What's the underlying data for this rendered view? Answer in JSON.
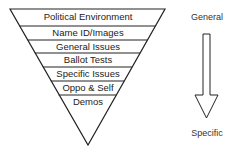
{
  "diagram": {
    "type": "inverted-funnel",
    "layers": [
      {
        "label": "Political Environment"
      },
      {
        "label": "Name ID/Images"
      },
      {
        "label": "General Issues"
      },
      {
        "label": "Ballot Tests"
      },
      {
        "label": "Specific Issues"
      },
      {
        "label": "Oppo & Self"
      },
      {
        "label": "Demos"
      }
    ],
    "arrow": {
      "top_label": "General",
      "bottom_label": "Specific",
      "direction": "down"
    },
    "colors": {
      "stroke": "#222222",
      "fill": "#ffffff",
      "text": "#222222"
    }
  }
}
